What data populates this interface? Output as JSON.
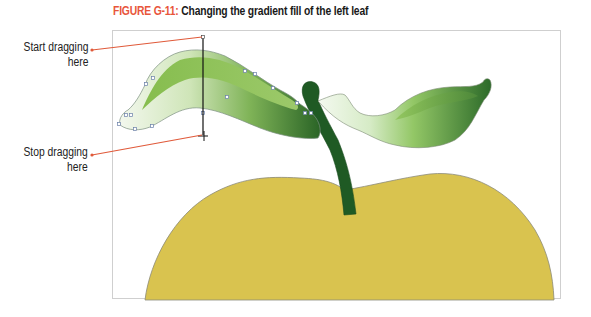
{
  "figure": {
    "number": "FIGURE G-11:",
    "title": "Changing the gradient fill of the left leaf"
  },
  "callouts": [
    {
      "id": "start",
      "line1": "Start dragging",
      "line2": "here"
    },
    {
      "id": "stop",
      "line1": "Stop dragging",
      "line2": "here"
    }
  ],
  "artwork": {
    "objects": [
      "left-leaf",
      "right-leaf",
      "stem",
      "apple"
    ],
    "selected_object": "left-leaf",
    "tool": "gradient-drag",
    "drag_direction": "top-to-bottom"
  },
  "colors": {
    "figure_label": "#e8553a",
    "callout_line": "#e05a3a",
    "apple_fill": "#d9c34f",
    "apple_outline": "#8a8a7a",
    "stem": "#1f5a24",
    "leaf_light": "#eef6e6",
    "leaf_mid": "#8fc25a",
    "leaf_dark": "#2e6b2a",
    "drag_line": "#111111"
  }
}
